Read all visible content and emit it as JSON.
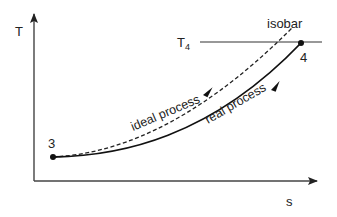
{
  "diagram": {
    "type": "T-s diagram",
    "axes": {
      "y_label": "T",
      "x_label": "s"
    },
    "reference_line": {
      "label": "T₄",
      "label_main": "T",
      "label_sub": "4"
    },
    "isobar_label": "isobar",
    "points": [
      {
        "id": "3",
        "label": "3"
      },
      {
        "id": "4",
        "label": "4"
      }
    ],
    "curves": [
      {
        "name": "ideal process",
        "label": "ideal process",
        "style": "dashed"
      },
      {
        "name": "real process",
        "label": "real process",
        "style": "solid"
      }
    ],
    "colors": {
      "line": "#222222",
      "background": "#ffffff"
    }
  }
}
